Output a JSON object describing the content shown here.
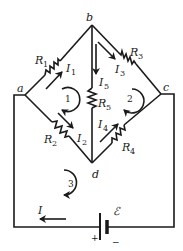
{
  "diagram": {
    "type": "circuit",
    "colors": {
      "wire": "#1a1a1a",
      "background": "#ffffff"
    },
    "nodes": [
      {
        "id": "a",
        "label": "a",
        "x": 25,
        "y": 95
      },
      {
        "id": "b",
        "label": "b",
        "x": 92,
        "y": 25
      },
      {
        "id": "c",
        "label": "c",
        "x": 161,
        "y": 94
      },
      {
        "id": "d",
        "label": "d",
        "x": 92,
        "y": 163
      }
    ],
    "resistors": [
      {
        "id": "R1",
        "label": "R",
        "sub": "1",
        "between": [
          "a",
          "b"
        ]
      },
      {
        "id": "R2",
        "label": "R",
        "sub": "2",
        "between": [
          "a",
          "d"
        ]
      },
      {
        "id": "R3",
        "label": "R",
        "sub": "3",
        "between": [
          "b",
          "c"
        ]
      },
      {
        "id": "R4",
        "label": "R",
        "sub": "4",
        "between": [
          "d",
          "c"
        ]
      },
      {
        "id": "R5",
        "label": "R",
        "sub": "5",
        "between": [
          "b",
          "d"
        ]
      }
    ],
    "currents": [
      {
        "id": "I1",
        "label": "I",
        "sub": "1",
        "direction": "a→b"
      },
      {
        "id": "I2",
        "label": "I",
        "sub": "2",
        "direction": "a→d"
      },
      {
        "id": "I3",
        "label": "I",
        "sub": "3",
        "direction": "b→c"
      },
      {
        "id": "I4",
        "label": "I",
        "sub": "4",
        "direction": "d→c"
      },
      {
        "id": "I5",
        "label": "I",
        "sub": "5",
        "direction": "b→d"
      },
      {
        "id": "I",
        "label": "I",
        "sub": "",
        "direction": "leftward in battery branch"
      }
    ],
    "loops": [
      {
        "id": "loop1",
        "label": "1",
        "direction": "clockwise"
      },
      {
        "id": "loop2",
        "label": "2",
        "direction": "clockwise"
      },
      {
        "id": "loop3",
        "label": "3",
        "direction": "clockwise"
      }
    ],
    "battery": {
      "label": "ℰ",
      "plus": "+",
      "minus": "−"
    }
  }
}
